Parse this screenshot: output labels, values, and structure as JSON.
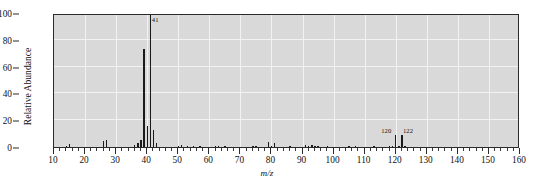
{
  "chart_data": {
    "type": "bar",
    "title": "",
    "subtitle": "",
    "xlabel": "m/z",
    "ylabel": "Relative Abundance",
    "xlim": [
      10,
      160
    ],
    "ylim": [
      0,
      100
    ],
    "x_major_step": 10,
    "x_minor_step": 2,
    "y_tick_step": 20,
    "grid": true,
    "legend": null,
    "xticklabels": [
      "10",
      "20",
      "30",
      "40",
      "50",
      "60",
      "70",
      "80",
      "90",
      "100",
      "110",
      "120",
      "130",
      "140",
      "150",
      "160"
    ],
    "yticklabels": [
      "0",
      "20",
      "40",
      "60",
      "80",
      "100"
    ],
    "annotations": [
      {
        "mz": 41,
        "text": "41",
        "dx": 2.5,
        "dy": 2
      },
      {
        "mz": 120,
        "text": "120",
        "dx": -13.5,
        "dy": 113
      },
      {
        "mz": 122,
        "text": "122",
        "dx": 2.0,
        "dy": 113
      }
    ],
    "x": [
      14,
      15,
      26,
      27,
      36,
      37,
      38,
      39,
      40,
      41,
      42,
      43,
      50,
      51,
      53,
      55,
      57,
      62,
      63,
      65,
      74,
      75,
      79,
      80,
      81,
      86,
      91,
      92,
      93,
      94,
      95,
      98,
      105,
      107,
      113,
      118,
      119,
      120,
      121,
      122,
      123
    ],
    "values": [
      1.0,
      2.6,
      4.2,
      5.0,
      1.6,
      3.0,
      5.4,
      73.0,
      16.0,
      100.0,
      12.5,
      3.0,
      0.8,
      1.2,
      0.7,
      0.9,
      0.7,
      0.6,
      0.8,
      0.7,
      0.6,
      0.7,
      3.4,
      1.0,
      3.2,
      0.7,
      1.6,
      1.0,
      1.4,
      0.9,
      1.1,
      0.7,
      0.6,
      0.6,
      0.6,
      0.7,
      0.8,
      9.0,
      1.0,
      9.0,
      0.9
    ],
    "base_peak_mz": 41,
    "base_peak_value": 100,
    "colors": {
      "peak": "#1a1a1a",
      "plot_background": "#d9d9d9",
      "grid": "#f2f2f2",
      "axis": "#2b2b2b",
      "text": "#111111",
      "figure_background": "#ffffff"
    }
  }
}
